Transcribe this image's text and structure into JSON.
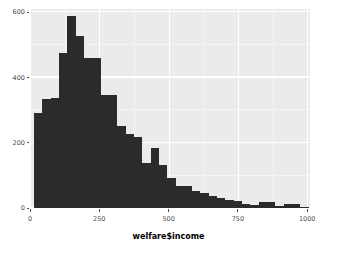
{
  "chart_data": {
    "type": "bar",
    "title": "",
    "subtitle": "",
    "xlabel": "welfare$income",
    "ylabel": "",
    "xlim": [
      0,
      1010
    ],
    "ylim": [
      0,
      610
    ],
    "grid": true,
    "legend": null,
    "binwidth": 30,
    "xticks": [
      0,
      250,
      500,
      750,
      1000
    ],
    "xtick_labels": [
      "0",
      "250",
      "500",
      "750",
      "1000"
    ],
    "yticks": [
      0,
      200,
      400,
      600
    ],
    "ytick_labels": [
      "0",
      "200",
      "400",
      "600"
    ],
    "x_minor_ticks": [
      125,
      375,
      625,
      875
    ],
    "y_minor_ticks": [
      100,
      300,
      500
    ],
    "bin_starts": [
      15,
      45,
      75,
      105,
      135,
      165,
      195,
      225,
      255,
      285,
      315,
      345,
      375,
      405,
      435,
      465,
      495,
      525,
      555,
      585,
      615,
      645,
      675,
      705,
      735,
      765,
      795,
      825,
      855,
      885,
      915,
      945,
      975
    ],
    "categories": [
      "15-45",
      "45-75",
      "75-105",
      "105-135",
      "135-165",
      "165-195",
      "195-225",
      "225-255",
      "255-285",
      "285-315",
      "315-345",
      "345-375",
      "375-405",
      "405-435",
      "435-465",
      "465-495",
      "495-525",
      "525-555",
      "555-585",
      "585-615",
      "615-645",
      "645-675",
      "675-705",
      "705-735",
      "735-765",
      "765-795",
      "795-825",
      "825-855",
      "855-885",
      "885-915",
      "915-945",
      "945-975",
      "975-1005"
    ],
    "values": [
      292,
      335,
      336,
      475,
      590,
      527,
      459,
      459,
      347,
      347,
      250,
      228,
      219,
      137,
      185,
      133,
      92,
      69,
      69,
      52,
      45,
      38,
      30,
      25,
      22,
      12,
      10,
      17,
      17,
      5,
      12,
      12,
      2
    ],
    "bar_color": "#2B2B2B",
    "panel_color": "#EBEBEB",
    "grid_color": "#FFFFFF",
    "text_color": "#4D4D4D"
  }
}
